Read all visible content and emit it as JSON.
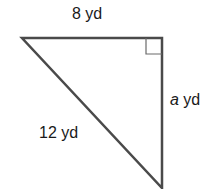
{
  "diagram": {
    "type": "right-triangle",
    "colors": {
      "stroke": "#4a4a4a",
      "text": "#1a1a1a",
      "background": "#ffffff"
    },
    "vertices": {
      "top_left": [
        22,
        38
      ],
      "top_right": [
        162,
        38
      ],
      "bottom": [
        162,
        188
      ]
    },
    "right_angle_at": "top_right",
    "labels": {
      "top": {
        "value": "8",
        "unit": "yd"
      },
      "right": {
        "variable": "a",
        "unit": "yd"
      },
      "hypotenuse": {
        "value": "12",
        "unit": "yd"
      }
    }
  }
}
